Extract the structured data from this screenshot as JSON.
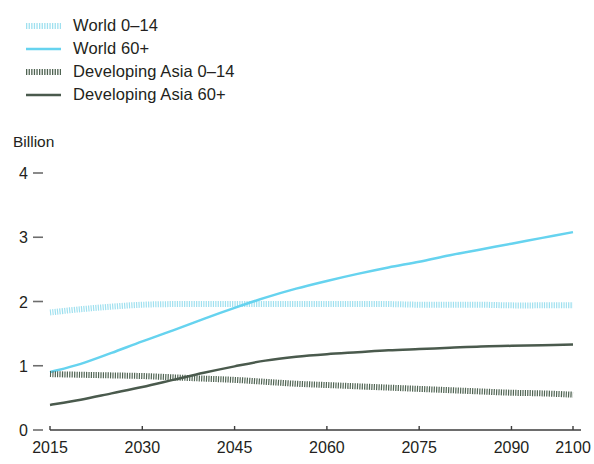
{
  "legend": {
    "items": [
      {
        "label": "World 0–14",
        "color": "#9fe0ef",
        "style": "dotted",
        "icon": "dotted-line-icon"
      },
      {
        "label": "World 60+",
        "color": "#66d3ef",
        "style": "solid",
        "icon": "solid-line-icon"
      },
      {
        "label": "Developing Asia 0–14",
        "color": "#4f6352",
        "style": "dotted",
        "icon": "dotted-line-icon"
      },
      {
        "label": "Developing Asia 60+",
        "color": "#4a5a4d",
        "style": "solid",
        "icon": "solid-line-icon"
      }
    ]
  },
  "axis": {
    "unit_label": "Billion",
    "y_ticks": [
      "0",
      "1",
      "2",
      "3",
      "4"
    ],
    "x_ticks": [
      "2015",
      "2030",
      "2045",
      "2060",
      "2075",
      "2090",
      "2100"
    ]
  },
  "chart_data": {
    "type": "line",
    "title": "",
    "subtitle": "",
    "xlabel": "",
    "ylabel": "Billion",
    "xlim": [
      2015,
      2100
    ],
    "ylim": [
      0,
      4
    ],
    "grid": false,
    "legend_position": "top-left",
    "x": [
      2015,
      2020,
      2025,
      2030,
      2035,
      2040,
      2045,
      2050,
      2055,
      2060,
      2065,
      2070,
      2075,
      2080,
      2085,
      2090,
      2095,
      2100
    ],
    "series": [
      {
        "name": "World 0–14",
        "color": "#9fe0ef",
        "style": "dotted",
        "values": [
          1.83,
          1.88,
          1.92,
          1.95,
          1.96,
          1.96,
          1.96,
          1.96,
          1.96,
          1.96,
          1.96,
          1.96,
          1.95,
          1.95,
          1.95,
          1.94,
          1.94,
          1.94
        ]
      },
      {
        "name": "World 60+",
        "color": "#66d3ef",
        "style": "solid",
        "values": [
          0.9,
          1.03,
          1.2,
          1.38,
          1.55,
          1.73,
          1.9,
          2.06,
          2.2,
          2.32,
          2.43,
          2.53,
          2.62,
          2.72,
          2.81,
          2.9,
          2.99,
          3.08
        ]
      },
      {
        "name": "Developing Asia 0–14",
        "color": "#4f6352",
        "style": "dotted",
        "values": [
          0.87,
          0.86,
          0.85,
          0.84,
          0.82,
          0.8,
          0.78,
          0.75,
          0.72,
          0.7,
          0.68,
          0.66,
          0.64,
          0.62,
          0.6,
          0.58,
          0.57,
          0.55
        ]
      },
      {
        "name": "Developing Asia 60+",
        "color": "#4a5a4d",
        "style": "solid",
        "values": [
          0.39,
          0.47,
          0.57,
          0.67,
          0.78,
          0.89,
          0.99,
          1.08,
          1.14,
          1.18,
          1.21,
          1.24,
          1.26,
          1.28,
          1.3,
          1.31,
          1.32,
          1.33
        ]
      }
    ],
    "annotations": []
  }
}
